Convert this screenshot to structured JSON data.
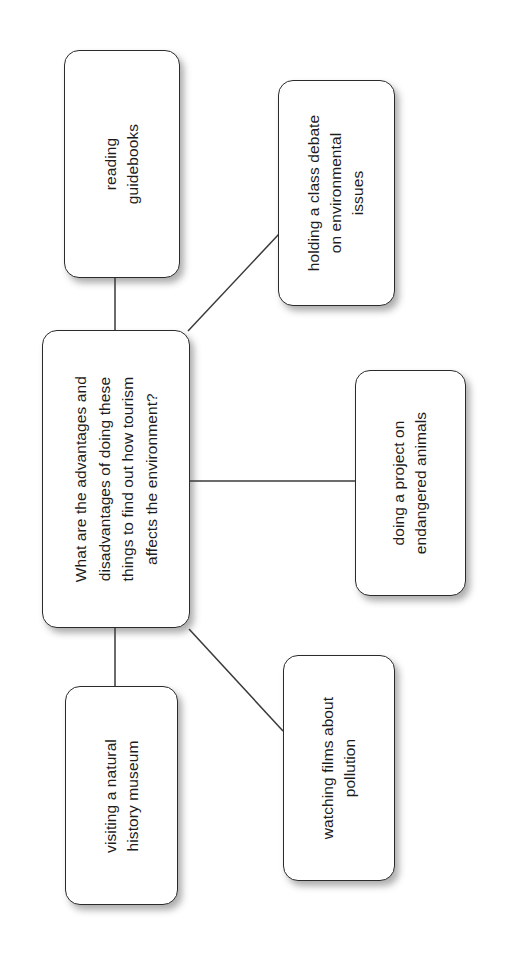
{
  "diagram": {
    "type": "mind-map",
    "background_color": "#ffffff",
    "node_fill_color": "#ffffff",
    "node_border_color": "#2b2b2b",
    "text_color": "#1c1c1c",
    "connector_color": "#3a3a3a",
    "text_orientation": "rotated-90-ccw",
    "center": {
      "id": "central",
      "lines": [
        "What are the advantages and",
        "disadvantages of doing these",
        "things to find out how tourism",
        "affects the environment?"
      ],
      "text": "What are the advantages and disadvantages of doing these things to find out how tourism affects the environment?"
    },
    "branches": [
      {
        "id": "reading",
        "lines": [
          "reading",
          "guidebooks"
        ],
        "text": "reading guidebooks",
        "connector": "vertical"
      },
      {
        "id": "debate",
        "lines": [
          "holding a class debate",
          "on environmental",
          "issues"
        ],
        "text": "holding a class debate on environmental issues",
        "connector": "diagonal"
      },
      {
        "id": "project",
        "lines": [
          "doing a project on",
          "endangered animals"
        ],
        "text": "doing a project on endangered animals",
        "connector": "horizontal"
      },
      {
        "id": "films",
        "lines": [
          "watching films about",
          "pollution"
        ],
        "text": "watching films about pollution",
        "connector": "diagonal"
      },
      {
        "id": "museum",
        "lines": [
          "visiting a natural",
          "history museum"
        ],
        "text": "visiting a natural history museum",
        "connector": "vertical"
      }
    ]
  }
}
